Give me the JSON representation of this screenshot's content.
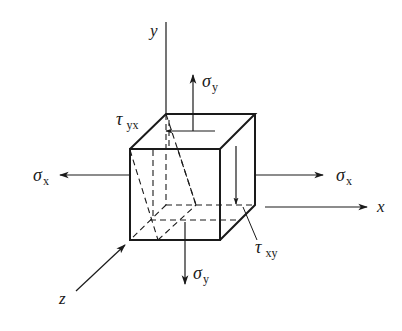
{
  "diagram": {
    "colors": {
      "ink": "#1a1a1a",
      "background": "#ffffff"
    },
    "axes": {
      "x": {
        "label": "x"
      },
      "y": {
        "label": "y"
      },
      "z": {
        "label": "z"
      }
    },
    "stresses": {
      "sigma_y_top": {
        "symbol": "σ",
        "subscript": "y"
      },
      "sigma_y_bottom": {
        "symbol": "σ",
        "subscript": "y"
      },
      "sigma_x_left": {
        "symbol": "σ",
        "subscript": "x"
      },
      "sigma_x_right": {
        "symbol": "σ",
        "subscript": "x"
      },
      "tau_yx": {
        "symbol": "τ",
        "subscript": "yx"
      },
      "tau_xy": {
        "symbol": "τ",
        "subscript": "xy"
      }
    }
  }
}
